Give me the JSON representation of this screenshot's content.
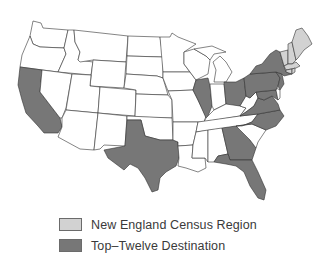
{
  "colors": {
    "background": "#ffffff",
    "default_state": "#ffffff",
    "new_england": "#d2d2d2",
    "top_twelve": "#777777",
    "border": "#333333"
  },
  "legend": {
    "items": [
      {
        "label": "New England Census Region",
        "color": "#d2d2d2"
      },
      {
        "label": "Top–Twelve Destination",
        "color": "#777777"
      }
    ]
  },
  "map": {
    "title": "",
    "new_england_states": [
      "Maine",
      "New Hampshire",
      "Vermont",
      "Massachusetts",
      "Rhode Island",
      "Connecticut"
    ],
    "top_twelve_states": [
      "California",
      "Texas",
      "Illinois",
      "Ohio",
      "Pennsylvania",
      "New York",
      "New Jersey",
      "Maryland",
      "Virginia",
      "North Carolina",
      "Georgia",
      "Florida"
    ]
  }
}
